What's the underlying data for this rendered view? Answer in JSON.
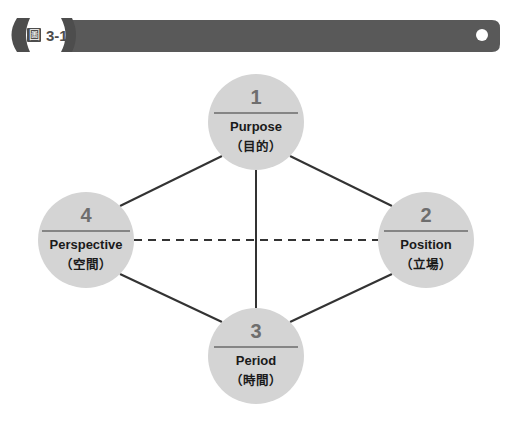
{
  "figure_bar": {
    "badge_icon": "figure-glyph-icon",
    "badge_glyph": "圖",
    "badge_label": "3-11",
    "bar_color": "#595959",
    "badge_color": "#4d4d4d",
    "hole_color": "#ffffff"
  },
  "diagram": {
    "node_fill": "#d4d4d4",
    "edge_color": "#333333",
    "nodes": [
      {
        "id": "purpose",
        "number": "1",
        "label_en": "Purpose",
        "label_zh": "（目的）",
        "cx": 256,
        "cy": 122,
        "r": 48
      },
      {
        "id": "position",
        "number": "2",
        "label_en": "Position",
        "label_zh": "（立場）",
        "cx": 426,
        "cy": 240,
        "r": 48
      },
      {
        "id": "period",
        "number": "3",
        "label_en": "Period",
        "label_zh": "（時間）",
        "cx": 256,
        "cy": 356,
        "r": 48
      },
      {
        "id": "perspective",
        "number": "4",
        "label_en": "Perspective",
        "label_zh": "（空間）",
        "cx": 86,
        "cy": 240,
        "r": 48
      }
    ],
    "edges": [
      {
        "id": "perspective-purpose",
        "from": "perspective",
        "to": "purpose",
        "style": "solid"
      },
      {
        "id": "purpose-position",
        "from": "purpose",
        "to": "position",
        "style": "solid"
      },
      {
        "id": "position-period",
        "from": "position",
        "to": "period",
        "style": "solid"
      },
      {
        "id": "period-perspective",
        "from": "period",
        "to": "perspective",
        "style": "solid"
      },
      {
        "id": "purpose-period",
        "from": "purpose",
        "to": "period",
        "style": "solid"
      },
      {
        "id": "perspective-position",
        "from": "perspective",
        "to": "position",
        "style": "dashed"
      }
    ]
  }
}
